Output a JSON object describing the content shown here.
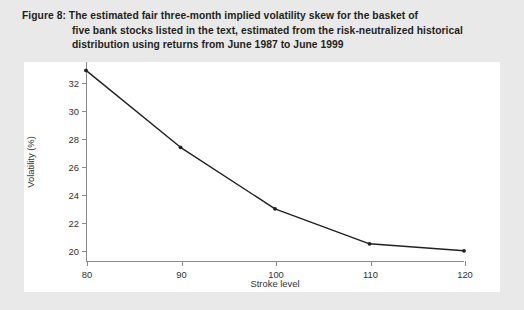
{
  "figure": {
    "caption_lines": [
      "Figure 8:  The estimated fair three-month implied volatility skew for the basket of",
      "five bank stocks listed in the text, estimated from the risk-neutralized historical",
      "distribution using returns from June 1987 to June 1999"
    ],
    "background_color": "#e9e9e9",
    "panel_color": "#ffffff",
    "line_color": "#231f20",
    "axis_color": "#8a8a8a"
  },
  "chart_data": {
    "type": "line",
    "xlabel": "Stroke level",
    "ylabel": "Volatility (%)",
    "x": [
      80,
      90,
      100,
      110,
      120
    ],
    "values": [
      32.9,
      27.4,
      23.0,
      20.5,
      20.0
    ],
    "series": [
      {
        "name": "Fair three-month implied volatility skew",
        "values": [
          32.9,
          27.4,
          23.0,
          20.5,
          20.0
        ]
      }
    ],
    "xlim": [
      80,
      120
    ],
    "ylim": [
      19.2,
      33.5
    ],
    "xticks": [
      80,
      90,
      100,
      110,
      120
    ],
    "xtick_labels": [
      "80",
      "90",
      "100",
      "110",
      "120"
    ],
    "yticks": [
      20,
      22,
      24,
      26,
      28,
      30,
      32
    ],
    "ytick_labels": [
      "20",
      "22",
      "24",
      "26",
      "28",
      "30",
      "32"
    ],
    "grid": false,
    "legend": false,
    "markers": true,
    "marker_style": "dot"
  }
}
